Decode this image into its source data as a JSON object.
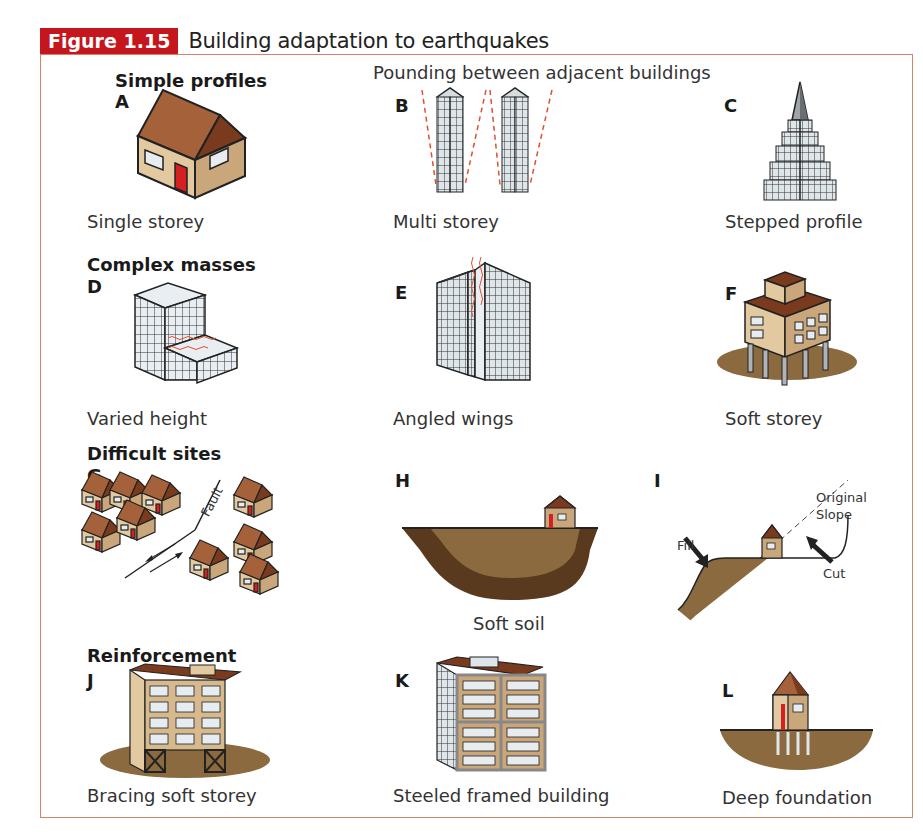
{
  "figure": {
    "number": "Figure 1.15",
    "title": "Building adaptation to earthquakes",
    "accent_color": "#c4161c",
    "frame_color": "#d8826a"
  },
  "sections": {
    "simple_profiles": "Simple profiles",
    "complex_masses": "Complex masses",
    "difficult_sites": "Difficult sites",
    "reinforcement": "Reinforcement"
  },
  "panels": [
    {
      "letter": "A",
      "caption": "Single storey"
    },
    {
      "letter": "B",
      "caption": "Multi storey",
      "note": "Pounding between adjacent buildings"
    },
    {
      "letter": "C",
      "caption": "Stepped profile"
    },
    {
      "letter": "D",
      "caption": "Varied height"
    },
    {
      "letter": "E",
      "caption": "Angled wings"
    },
    {
      "letter": "F",
      "caption": "Soft storey"
    },
    {
      "letter": "G",
      "caption": "",
      "label": "Fault"
    },
    {
      "letter": "H",
      "caption": "Soft soil"
    },
    {
      "letter": "I",
      "caption": "",
      "labels": {
        "original_slope_1": "Original",
        "original_slope_2": "Slope",
        "fill": "Fill",
        "cut": "Cut"
      }
    },
    {
      "letter": "J",
      "caption": "Bracing soft storey"
    },
    {
      "letter": "K",
      "caption": "Steeled framed building"
    },
    {
      "letter": "L",
      "caption": "Deep foundation"
    }
  ],
  "colors": {
    "roof": "#a5623a",
    "roof_dark": "#7a3a1e",
    "wall": "#e2c9a0",
    "wall_dark": "#c9a77a",
    "door": "#d42020",
    "soil": "#8a6a3e",
    "soil_dark": "#5a3a1e",
    "glass": "#e6ecf0",
    "crack": "#e05030"
  }
}
